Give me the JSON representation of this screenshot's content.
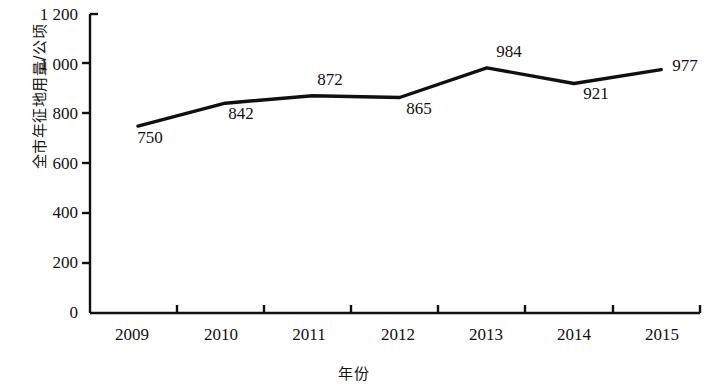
{
  "chart_data": {
    "type": "line",
    "title": "",
    "xlabel": "年份",
    "ylabel": "全市年征地用量/公顷",
    "categories": [
      "2009",
      "2010",
      "2011",
      "2012",
      "2013",
      "2014",
      "2015"
    ],
    "values": [
      750,
      842,
      872,
      865,
      984,
      921,
      977
    ],
    "point_labels": [
      "750",
      "842",
      "872",
      "865",
      "984",
      "921",
      "977"
    ],
    "series": [
      {
        "name": "全市年征地用量",
        "values": [
          750,
          842,
          872,
          865,
          984,
          921,
          977
        ]
      }
    ],
    "ylim": [
      0,
      1200
    ],
    "ytick_values": [
      0,
      200,
      400,
      600,
      800,
      1000,
      1200
    ],
    "ytick_labels": [
      "0",
      "200",
      "400",
      "600",
      "800",
      "1 000",
      "1 200"
    ],
    "xtick_labels": [
      "2009",
      "2010",
      "2011",
      "2012",
      "2013",
      "2014",
      "2015"
    ],
    "grid": false,
    "legend": null,
    "legend_position": "none",
    "line_color": "#101010",
    "axis_color": "#101010",
    "background_color": "#ffffff",
    "markers": false
  }
}
